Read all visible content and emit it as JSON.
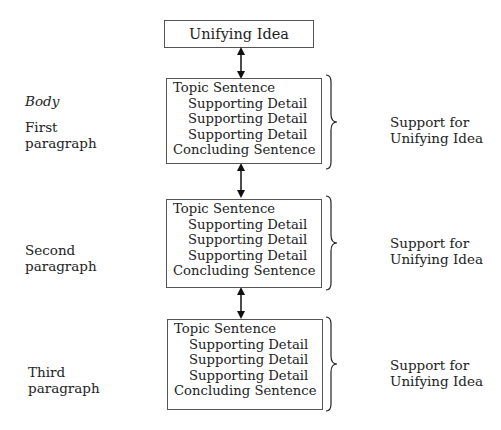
{
  "diagram": {
    "top": {
      "label": "Unifying Idea"
    },
    "body_label": "Body",
    "paragraphs": [
      {
        "name_line1": "First",
        "name_line2": "paragraph",
        "lines": [
          "Topic Sentence",
          "Supporting Detail",
          "Supporting Detail",
          "Supporting Detail",
          "Concluding Sentence"
        ],
        "right_line1": "Support for",
        "right_line2": "Unifying Idea"
      },
      {
        "name_line1": "Second",
        "name_line2": "paragraph",
        "lines": [
          "Topic Sentence",
          "Supporting Detail",
          "Supporting Detail",
          "Supporting Detail",
          "Concluding Sentence"
        ],
        "right_line1": "Support for",
        "right_line2": "Unifying Idea"
      },
      {
        "name_line1": "Third",
        "name_line2": "paragraph",
        "lines": [
          "Topic Sentence",
          "Supporting Detail",
          "Supporting Detail",
          "Supporting Detail",
          "Concluding Sentence"
        ],
        "right_line1": "Support for",
        "right_line2": "Unifying Idea"
      }
    ]
  }
}
